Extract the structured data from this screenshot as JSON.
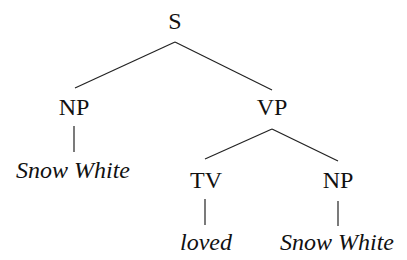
{
  "diagram": {
    "type": "syntax-tree",
    "nodes": {
      "s": {
        "label": "S",
        "kind": "category"
      },
      "np_subj": {
        "label": "NP",
        "kind": "category"
      },
      "vp": {
        "label": "VP",
        "kind": "category"
      },
      "np_subj_word": {
        "label": "Snow White",
        "kind": "word"
      },
      "tv": {
        "label": "TV",
        "kind": "category"
      },
      "np_obj": {
        "label": "NP",
        "kind": "category"
      },
      "tv_word": {
        "label": "loved",
        "kind": "word"
      },
      "np_obj_word": {
        "label": "Snow White",
        "kind": "word"
      }
    },
    "edges": [
      [
        "S",
        "NP"
      ],
      [
        "S",
        "VP"
      ],
      [
        "NP",
        "Snow White"
      ],
      [
        "VP",
        "TV"
      ],
      [
        "VP",
        "NP"
      ],
      [
        "TV",
        "loved"
      ],
      [
        "NP",
        "Snow White"
      ]
    ]
  }
}
